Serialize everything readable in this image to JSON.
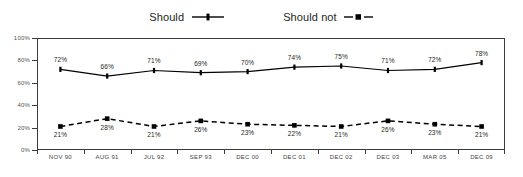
{
  "chart_data": {
    "type": "line",
    "title": "",
    "xlabel": "",
    "ylabel": "",
    "ylim": [
      0,
      100
    ],
    "yticks": [
      "0%",
      "20%",
      "40%",
      "60%",
      "80%",
      "100%"
    ],
    "ytick_values": [
      0,
      20,
      40,
      60,
      80,
      100
    ],
    "grid": false,
    "legend_position": "top-center",
    "categories": [
      "NOV 90",
      "AUG 91",
      "JUL 92",
      "SEP 93",
      "DEC 00",
      "DEC 01",
      "DEC 02",
      "DEC 03",
      "MAR 05",
      "DEC 09"
    ],
    "series": [
      {
        "name": "Should",
        "values": [
          72,
          66,
          71,
          69,
          70,
          74,
          75,
          71,
          72,
          78
        ],
        "labels": [
          "72%",
          "66%",
          "71%",
          "69%",
          "70%",
          "74%",
          "75%",
          "71%",
          "72%",
          "78%"
        ],
        "line_style": "solid",
        "marker": "diamond",
        "color": "#000000"
      },
      {
        "name": "Should not",
        "values": [
          21,
          28,
          21,
          26,
          23,
          22,
          21,
          26,
          23,
          21
        ],
        "labels": [
          "21%",
          "28%",
          "21%",
          "26%",
          "23%",
          "22%",
          "21%",
          "26%",
          "23%",
          "21%"
        ],
        "line_style": "dashed",
        "marker": "square",
        "color": "#000000"
      }
    ]
  },
  "legend": {
    "entries": [
      {
        "label": "Should",
        "key": "solid-line-marker-key"
      },
      {
        "label": "Should not",
        "key": "dashed-line-square-key"
      }
    ]
  },
  "colors": {
    "series": "#000000",
    "frame": "#3b3b3b",
    "axis_text": "#555253",
    "label_text": "#231f20",
    "background": "#ffffff"
  }
}
